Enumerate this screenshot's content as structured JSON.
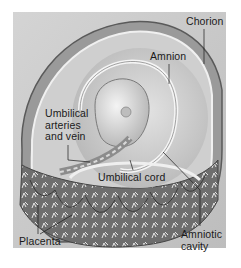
{
  "figure": {
    "style": "grayscale anatomical illustration",
    "labels": {
      "chorion": "Chorion",
      "amnion": "Amnion",
      "umbilical_vessels": "Umbilical\narteries\nand vein",
      "umbilical_cord": "Umbilical cord",
      "amniotic_cavity": "Amniotic\ncavity",
      "placenta": "Placenta"
    }
  }
}
